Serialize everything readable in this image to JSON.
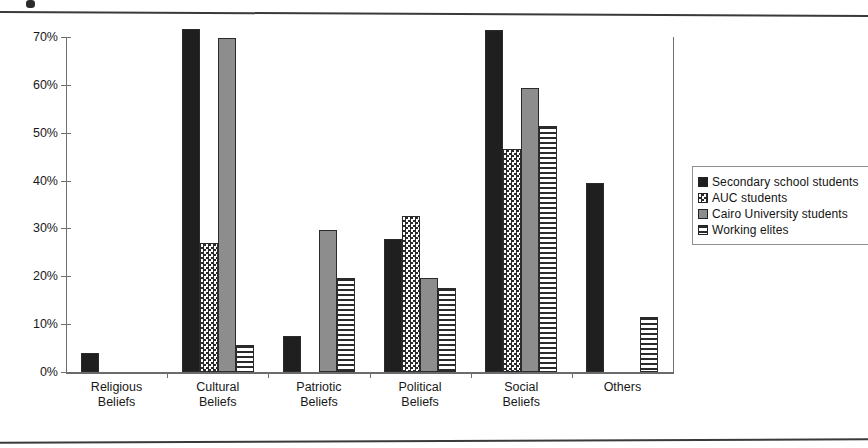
{
  "chart_data": {
    "type": "bar",
    "title": "",
    "xlabel": "",
    "ylabel": "",
    "ylim": [
      0,
      75
    ],
    "ytick_values": [
      0,
      10,
      20,
      30,
      40,
      50,
      60,
      70
    ],
    "ytick_labels": [
      "0%",
      "10%",
      "20%",
      "30%",
      "40%",
      "50%",
      "60%",
      "70%"
    ],
    "grid": false,
    "legend_position": "right",
    "categories": [
      "Religious\nBeliefs",
      "Cultural\nBeliefs",
      "Patriotic\nBeliefs",
      "Political\nBeliefs",
      "Social\nBeliefs",
      "Others"
    ],
    "series": [
      {
        "name": "Secondary school students",
        "pattern": "solid-black",
        "color": "#1f1f1f",
        "values": [
          3.9,
          71.6,
          7.5,
          27.8,
          71.5,
          39.4
        ]
      },
      {
        "name": "AUC students",
        "pattern": "checkered",
        "color": "#ffffff",
        "values": [
          0,
          27.0,
          0,
          32.6,
          46.5,
          0
        ]
      },
      {
        "name": "Cairo University students",
        "pattern": "solid-gray",
        "color": "#8d8d8d",
        "values": [
          0,
          69.8,
          29.7,
          19.6,
          59.4,
          0
        ]
      },
      {
        "name": "Working elites",
        "pattern": "horizontal-stripes",
        "color": "#ffffff",
        "values": [
          0,
          5.6,
          19.7,
          17.5,
          51.4,
          11.4
        ]
      }
    ]
  },
  "legend": {
    "items": [
      {
        "label": "Secondary school students",
        "pattern": "solid-black"
      },
      {
        "label": "AUC students",
        "pattern": "checkered"
      },
      {
        "label": "Cairo University students",
        "pattern": "solid-gray"
      },
      {
        "label": "Working elites",
        "pattern": "horizontal-stripes"
      }
    ]
  }
}
